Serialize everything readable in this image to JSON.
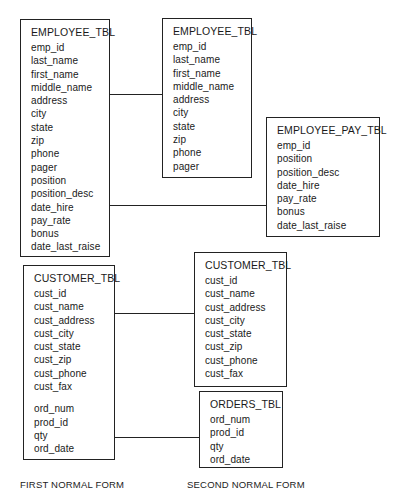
{
  "first_normal_form": {
    "employee_tbl": {
      "title": "EMPLOYEE_TBL",
      "fields": [
        "emp_id",
        "last_name",
        "first_name",
        "middle_name",
        "address",
        "city",
        "state",
        "zip",
        "phone",
        "pager",
        "position",
        "position_desc",
        "date_hire",
        "pay_rate",
        "bonus",
        "date_last_raise"
      ]
    },
    "customer_tbl": {
      "title": "CUSTOMER_TBL",
      "fields": [
        "cust_id",
        "cust_name",
        "cust_address",
        "cust_city",
        "cust_state",
        "cust_zip",
        "cust_phone",
        "cust_fax"
      ],
      "order_fields": [
        "ord_num",
        "prod_id",
        "qty",
        "ord_date"
      ]
    },
    "caption": "FIRST NORMAL FORM"
  },
  "second_normal_form": {
    "employee_tbl": {
      "title": "EMPLOYEE_TBL",
      "fields": [
        "emp_id",
        "last_name",
        "first_name",
        "middle_name",
        "address",
        "city",
        "state",
        "zip",
        "phone",
        "pager"
      ]
    },
    "employee_pay_tbl": {
      "title": "EMPLOYEE_PAY_TBL",
      "fields": [
        "emp_id",
        "position",
        "position_desc",
        "date_hire",
        "pay_rate",
        "bonus",
        "date_last_raise"
      ]
    },
    "customer_tbl": {
      "title": "CUSTOMER_TBL",
      "fields": [
        "cust_id",
        "cust_name",
        "cust_address",
        "cust_city",
        "cust_state",
        "cust_zip",
        "cust_phone",
        "cust_fax"
      ]
    },
    "orders_tbl": {
      "title": "ORDERS_TBL",
      "fields": [
        "ord_num",
        "prod_id",
        "qty",
        "ord_date"
      ]
    },
    "caption": "SECOND NORMAL FORM"
  },
  "colors": {
    "line": "#222222",
    "text": "#1a1a1a",
    "background": "#ffffff"
  }
}
